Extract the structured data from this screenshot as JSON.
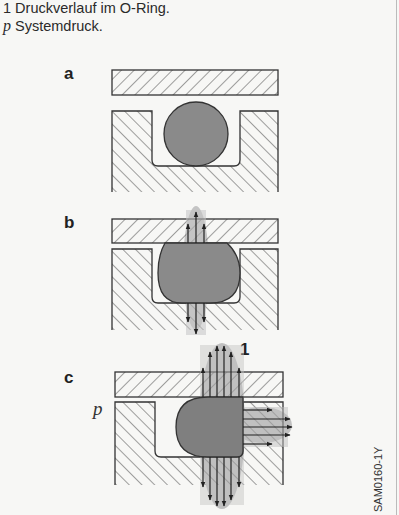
{
  "caption": {
    "line1": "1 Druckverlauf im O-Ring.",
    "line2_symbol": "p",
    "line2_text": " Systemdruck."
  },
  "panels": [
    {
      "label": "a",
      "state": "O-ring installed, unpressurized"
    },
    {
      "label": "b",
      "state": "O-ring compressed, pressure distribution vertical"
    },
    {
      "label": "c",
      "state": "System pressure p applied, O-ring pushed to groove wall"
    }
  ],
  "annotations": {
    "pressure_profile_label": "1",
    "system_pressure_label": "p"
  },
  "figure_code": "SAM0160-1Y",
  "colors": {
    "background": "#f7f7f5",
    "outline": "#333333",
    "oring_fill": "#8a8a8a",
    "pressure_zone": "#b8b8b8"
  }
}
